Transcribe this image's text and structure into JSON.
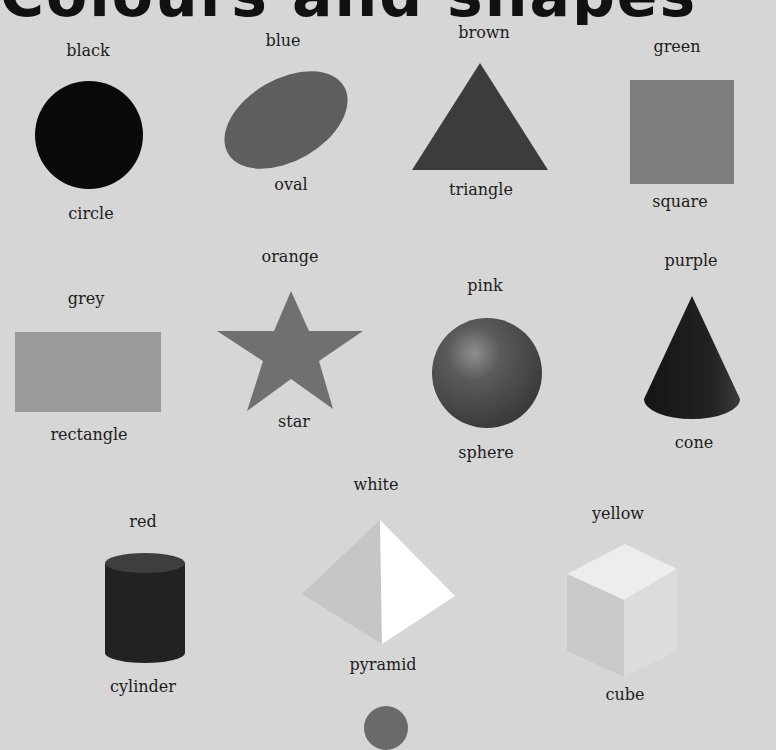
{
  "page": {
    "title": "Colours and shapes"
  },
  "items": [
    {
      "colour": "black",
      "shape": "circle",
      "colour_hex": "#0a0a0a"
    },
    {
      "colour": "blue",
      "shape": "oval",
      "colour_hex": "#5e5e5e"
    },
    {
      "colour": "brown",
      "shape": "triangle",
      "colour_hex": "#3c3c3c"
    },
    {
      "colour": "green",
      "shape": "square",
      "colour_hex": "#7d7d7d"
    },
    {
      "colour": "grey",
      "shape": "rectangle",
      "colour_hex": "#9a9a9a"
    },
    {
      "colour": "orange",
      "shape": "star",
      "colour_hex": "#707070"
    },
    {
      "colour": "pink",
      "shape": "sphere",
      "colour_hex": "#5a5a5a"
    },
    {
      "colour": "purple",
      "shape": "cone",
      "colour_hex": "#1e1e1e"
    },
    {
      "colour": "red",
      "shape": "cylinder",
      "colour_hex": "#2a2a2a"
    },
    {
      "colour": "white",
      "shape": "pyramid",
      "colour_hex": "#ffffff"
    },
    {
      "colour": "yellow",
      "shape": "cube",
      "colour_hex": "#e4e4e4"
    }
  ]
}
